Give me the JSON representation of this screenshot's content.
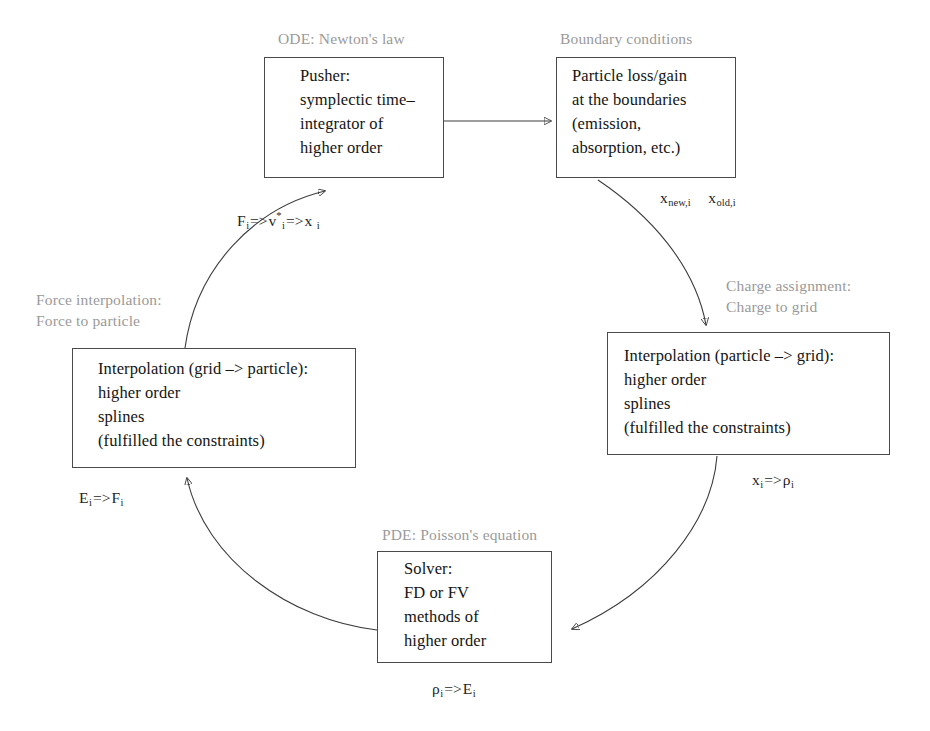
{
  "diagram": {
    "type": "cycle-flow-diagram",
    "stroke_color": "#3c3c3c",
    "caption_color": "#9a9a9a",
    "text_color": "#141414"
  },
  "boxes": [
    {
      "id": "pusher",
      "caption": "ODE: Newton's law",
      "text": "Pusher:\nsymplectic time–\nintegrator of\nhigher order"
    },
    {
      "id": "boundary",
      "caption": "Boundary conditions",
      "text": "Particle loss/gain\nat the boundaries\n(emission,\nabsorption, etc.)"
    },
    {
      "id": "charge-assignment",
      "caption": "Charge assignment:\nCharge to grid",
      "text": "Interpolation (particle –> grid):\nhigher order\nsplines\n(fulfilled the constraints)"
    },
    {
      "id": "solver",
      "caption": "PDE: Poisson's equation",
      "text": "Solver:\nFD or FV\nmethods of\nhigher order"
    },
    {
      "id": "force-interpolation",
      "caption": "Force interpolation:\nForce to particle",
      "text": "Interpolation (grid –> particle):\nhigher order\nsplines\n(fulfilled the constraints)"
    }
  ],
  "edge_labels": {
    "pusher_to_boundary": "",
    "boundary_out": {
      "first": "x",
      "first_sub": "new,i",
      "second": "x",
      "second_sub": "old,i"
    },
    "charge_out": {
      "lhs": "x",
      "lhs_sub": "i",
      "op": "=>",
      "rhs": "ρ",
      "rhs_sub": "i"
    },
    "solver_out": {
      "lhs": "ρ",
      "lhs_sub": "i",
      "op": "=>",
      "rhs": "E",
      "rhs_sub": "i"
    },
    "force_out": {
      "lhs": "E",
      "lhs_sub": "i",
      "op": "=>",
      "rhs": "F",
      "rhs_sub": "i"
    },
    "force_to_pusher": {
      "lhs": "F",
      "lhs_sub": "i",
      "op1": "=>",
      "mid": "v",
      "mid_sup": "*",
      "mid_sub": "i",
      "op2": "=>",
      "rhs": "x",
      "rhs_sub": "i"
    }
  },
  "arrows": [
    {
      "id": "pusher-to-boundary",
      "from": "pusher",
      "to": "boundary",
      "shape": "straight"
    },
    {
      "id": "boundary-to-charge",
      "from": "boundary",
      "to": "charge-assignment",
      "shape": "curved"
    },
    {
      "id": "charge-to-solver",
      "from": "charge-assignment",
      "to": "solver",
      "shape": "curved"
    },
    {
      "id": "solver-to-force",
      "from": "solver",
      "to": "force-interpolation",
      "shape": "curved"
    },
    {
      "id": "force-to-pusher",
      "from": "force-interpolation",
      "to": "pusher",
      "shape": "curved"
    }
  ]
}
